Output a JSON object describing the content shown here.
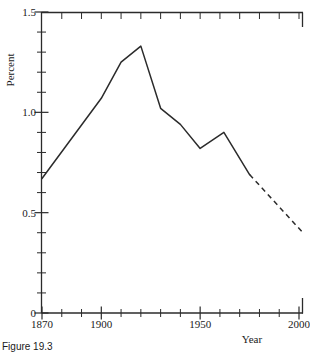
{
  "figure": {
    "caption": "Figure 19.3"
  },
  "chart_data": {
    "type": "line",
    "title": "",
    "xlabel": "Year",
    "ylabel": "Percent",
    "xlim": [
      1870,
      2002
    ],
    "ylim": [
      0,
      1.5
    ],
    "grid": false,
    "legend": "none",
    "x_ticks_major": [
      1870,
      1900,
      1950,
      2000
    ],
    "x_tick_labels": [
      "1870",
      "1900",
      "1950",
      "2000"
    ],
    "x_tick_minor_step": 10,
    "y_ticks_major": [
      0,
      0.5,
      1.0,
      1.5
    ],
    "y_tick_labels": [
      "0",
      "0.5",
      "1.0",
      "1.5"
    ],
    "y_tick_minor_step": 0.1,
    "series": [
      {
        "name": "observed",
        "style": "solid",
        "x": [
          1870,
          1900,
          1910,
          1920,
          1930,
          1940,
          1950,
          1962,
          1975
        ],
        "values": [
          0.67,
          1.07,
          1.25,
          1.33,
          1.02,
          0.94,
          0.82,
          0.9,
          0.69
        ]
      },
      {
        "name": "projected",
        "style": "dashed",
        "x": [
          1975,
          2002
        ],
        "values": [
          0.69,
          0.4
        ]
      }
    ]
  }
}
